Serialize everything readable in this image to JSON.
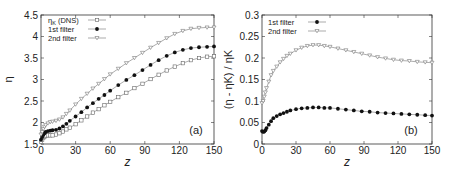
{
  "chart_data": [
    {
      "type": "line",
      "panel_label": "(a)",
      "xlabel": "z",
      "ylabel": "η",
      "xlim": [
        0,
        150
      ],
      "ylim": [
        1.5,
        4.5
      ],
      "xticks": [
        "0",
        "30",
        "60",
        "90",
        "120",
        "150"
      ],
      "yticks": [
        "1.5",
        "2",
        "2.5",
        "3",
        "3.5",
        "4",
        "4.5"
      ],
      "legend_position": "top-left",
      "series": [
        {
          "name": "ηK (DNS)",
          "marker": "open-square",
          "x": [
            0,
            1,
            2,
            3,
            4,
            6,
            8,
            10,
            13,
            16,
            19,
            22,
            25,
            30,
            35,
            40,
            45,
            50,
            55,
            60,
            67,
            74,
            81,
            88,
            95,
            102,
            109,
            116,
            123,
            130,
            137,
            144,
            150
          ],
          "values": [
            1.55,
            1.6,
            1.64,
            1.67,
            1.69,
            1.7,
            1.7,
            1.7,
            1.72,
            1.75,
            1.79,
            1.84,
            1.88,
            1.96,
            2.05,
            2.14,
            2.23,
            2.31,
            2.4,
            2.48,
            2.59,
            2.69,
            2.8,
            2.9,
            3.01,
            3.11,
            3.21,
            3.3,
            3.38,
            3.45,
            3.5,
            3.53,
            3.54
          ]
        },
        {
          "name": "1st filter",
          "marker": "filled-circle",
          "x": [
            0,
            1,
            2,
            3,
            4,
            6,
            8,
            10,
            13,
            16,
            19,
            22,
            25,
            30,
            35,
            40,
            45,
            50,
            55,
            60,
            67,
            74,
            81,
            88,
            95,
            102,
            109,
            116,
            123,
            130,
            137,
            144,
            150
          ],
          "values": [
            1.6,
            1.66,
            1.71,
            1.75,
            1.78,
            1.8,
            1.81,
            1.82,
            1.83,
            1.86,
            1.91,
            1.97,
            2.04,
            2.14,
            2.24,
            2.35,
            2.45,
            2.55,
            2.64,
            2.74,
            2.87,
            2.99,
            3.1,
            3.22,
            3.34,
            3.45,
            3.55,
            3.63,
            3.69,
            3.73,
            3.75,
            3.76,
            3.77
          ]
        },
        {
          "name": "2nd filter",
          "marker": "open-triangle-down",
          "x": [
            0,
            1,
            2,
            3,
            4,
            6,
            8,
            10,
            13,
            16,
            19,
            22,
            25,
            30,
            35,
            40,
            45,
            50,
            55,
            60,
            67,
            74,
            81,
            88,
            95,
            102,
            109,
            116,
            123,
            130,
            137,
            144,
            150
          ],
          "values": [
            1.72,
            1.78,
            1.85,
            1.9,
            1.94,
            1.98,
            2.01,
            2.02,
            2.04,
            2.07,
            2.12,
            2.2,
            2.28,
            2.42,
            2.55,
            2.67,
            2.79,
            2.9,
            3.01,
            3.12,
            3.25,
            3.38,
            3.5,
            3.62,
            3.74,
            3.85,
            3.96,
            4.06,
            4.13,
            4.18,
            4.2,
            4.21,
            4.21
          ]
        }
      ]
    },
    {
      "type": "line",
      "panel_label": "(b)",
      "xlabel": "z",
      "ylabel": "(η - ηK) / ηK",
      "xlim": [
        0,
        150
      ],
      "ylim": [
        0,
        0.3
      ],
      "xticks": [
        "0",
        "30",
        "60",
        "90",
        "120",
        "150"
      ],
      "yticks": [
        "0",
        "0.05",
        "0.1",
        "0.15",
        "0.2",
        "0.25",
        "0.3"
      ],
      "legend_position": "top-left",
      "series": [
        {
          "name": "1st filter",
          "marker": "filled-circle",
          "x": [
            0,
            1,
            2,
            3,
            4,
            6,
            8,
            10,
            13,
            16,
            19,
            22,
            25,
            30,
            35,
            40,
            45,
            50,
            55,
            60,
            67,
            74,
            81,
            88,
            95,
            102,
            109,
            116,
            123,
            130,
            137,
            144,
            150
          ],
          "values": [
            0.03,
            0.028,
            0.029,
            0.032,
            0.037,
            0.045,
            0.053,
            0.06,
            0.065,
            0.069,
            0.072,
            0.075,
            0.078,
            0.081,
            0.083,
            0.084,
            0.085,
            0.085,
            0.084,
            0.084,
            0.082,
            0.08,
            0.078,
            0.076,
            0.075,
            0.073,
            0.072,
            0.071,
            0.07,
            0.069,
            0.068,
            0.067,
            0.066
          ]
        },
        {
          "name": "2nd filter",
          "marker": "open-triangle-down",
          "x": [
            0,
            1,
            2,
            3,
            4,
            6,
            8,
            10,
            13,
            16,
            19,
            22,
            25,
            30,
            35,
            40,
            45,
            50,
            55,
            60,
            67,
            74,
            81,
            88,
            95,
            102,
            109,
            116,
            123,
            130,
            137,
            144,
            150
          ],
          "values": [
            0.095,
            0.1,
            0.11,
            0.12,
            0.13,
            0.145,
            0.16,
            0.17,
            0.18,
            0.19,
            0.198,
            0.205,
            0.21,
            0.218,
            0.224,
            0.228,
            0.23,
            0.23,
            0.228,
            0.226,
            0.222,
            0.218,
            0.214,
            0.21,
            0.206,
            0.202,
            0.199,
            0.196,
            0.194,
            0.193,
            0.191,
            0.19,
            0.189
          ]
        }
      ]
    }
  ]
}
